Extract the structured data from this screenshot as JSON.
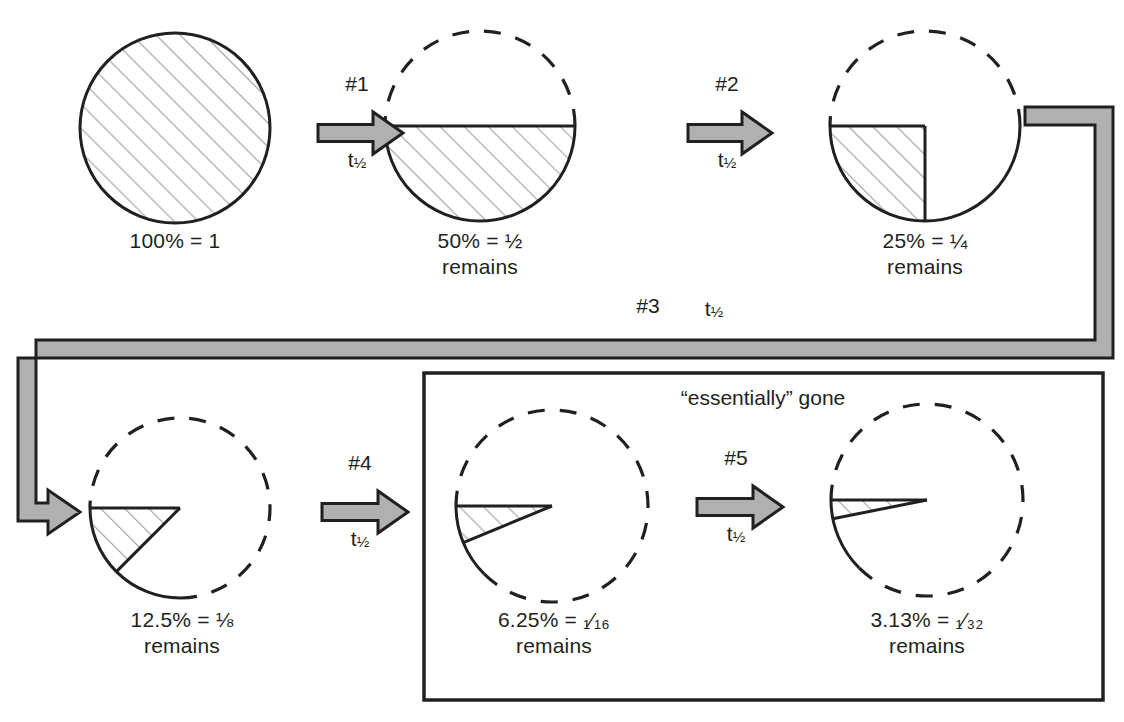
{
  "diagram": {
    "colors": {
      "ink": "#231f20",
      "hatch": "#a9a9a9",
      "arrow_fill": "#b0b0b0",
      "background": "#ffffff"
    },
    "stages": [
      {
        "id": "stage-100",
        "percent_label": "100% = 1",
        "remains_label": "",
        "fraction_remaining": 1,
        "shaded_degrees": 360,
        "outline": "solid",
        "cx": 175,
        "cy": 128,
        "r": 95,
        "label_x": 175,
        "label_y": 239
      },
      {
        "id": "stage-50",
        "percent_label": "50% = ½",
        "remains_label": "remains",
        "fraction_remaining": 0.5,
        "shaded_degrees": 180,
        "outline": "half-dashed",
        "cx": 480,
        "cy": 126,
        "r": 95,
        "label_x": 480,
        "label_y": 239
      },
      {
        "id": "stage-25",
        "percent_label": "25% = ¼",
        "remains_label": "remains",
        "fraction_remaining": 0.25,
        "shaded_degrees": 90,
        "outline": "mostly-dashed",
        "cx": 925,
        "cy": 126,
        "r": 95,
        "label_x": 925,
        "label_y": 239
      },
      {
        "id": "stage-12-5",
        "percent_label": "12.5% = ⅛",
        "remains_label": "remains",
        "fraction_remaining": 0.125,
        "shaded_degrees": 45,
        "outline": "dashed",
        "cx": 180,
        "cy": 508,
        "r": 90,
        "label_x": 182,
        "label_y": 618
      },
      {
        "id": "stage-6-25",
        "percent_label": "6.25% = ₁⁄₁₆",
        "remains_label": "remains",
        "fraction_remaining": 0.0625,
        "shaded_degrees": 22.5,
        "outline": "dashed",
        "cx": 552,
        "cy": 506,
        "r": 96,
        "label_x": 554,
        "label_y": 618
      },
      {
        "id": "stage-3-13",
        "percent_label": "3.13% = ₁⁄₃₂",
        "remains_label": "remains",
        "fraction_remaining": 0.0313,
        "shaded_degrees": 11.25,
        "outline": "dashed",
        "cx": 927,
        "cy": 500,
        "r": 96,
        "label_x": 927,
        "label_y": 618
      }
    ],
    "arrows": [
      {
        "id": "arrow-1",
        "step": "#1",
        "time": "t",
        "time_sub": "1/2",
        "x1": 318,
        "x2": 403,
        "y": 133,
        "step_x": 357,
        "step_y": 84,
        "time_x": 357,
        "time_y": 160
      },
      {
        "id": "arrow-2",
        "step": "#2",
        "time": "t",
        "time_sub": "1/2",
        "x1": 688,
        "x2": 772,
        "y": 133,
        "step_x": 727,
        "step_y": 84,
        "time_x": 727,
        "time_y": 160
      },
      {
        "id": "arrow-4",
        "step": "#4",
        "time": "t",
        "time_sub": "1/2",
        "x1": 322,
        "x2": 408,
        "y": 512,
        "step_x": 360,
        "step_y": 463,
        "time_x": 360,
        "time_y": 539
      },
      {
        "id": "arrow-5",
        "step": "#5",
        "time": "t",
        "time_sub": "1/2",
        "x1": 697,
        "x2": 783,
        "y": 507,
        "step_x": 736,
        "step_y": 458,
        "time_x": 736,
        "time_y": 534
      }
    ],
    "connector": {
      "id": "connector-3",
      "step": "#3",
      "time": "t",
      "time_sub": "1/2",
      "step_x": 648,
      "step_y": 306,
      "time_x": 714,
      "time_y": 309
    },
    "callout_box": {
      "id": "essentially-gone-box",
      "label": "“essentially” gone",
      "x": 424,
      "y": 373,
      "w": 679,
      "h": 327,
      "label_x": 763,
      "label_y": 398
    }
  }
}
